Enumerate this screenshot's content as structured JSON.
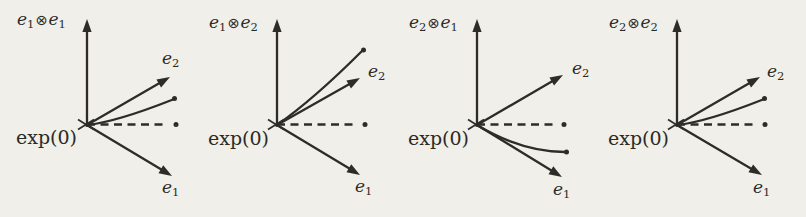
{
  "figure": {
    "background": "#f1efe9",
    "ink": "#2e2c29",
    "basis_base": "e",
    "tensor_op": "⊗",
    "e1_sub": "1",
    "e2_sub": "2",
    "origin_label": "exp(0)",
    "panels": [
      {
        "id": "e1e1",
        "left_sub": "1",
        "right_sub": "1",
        "labels": {
          "title": {
            "x": 17,
            "y": 10
          },
          "exp": {
            "x": 16,
            "y": 127
          },
          "e2": {
            "x": 162,
            "y": 49
          },
          "e1": {
            "x": 162,
            "y": 178
          }
        },
        "geometry": {
          "origin": {
            "x": 87,
            "y": 125
          },
          "axis_tip": {
            "x": 87,
            "y": 19
          },
          "e2_tip": {
            "x": 170,
            "y": 77
          },
          "e1_tip": {
            "x": 172,
            "y": 176
          },
          "dash_end": {
            "x": 168,
            "y": 124.5
          },
          "dash_dot": {
            "x": 176,
            "y": 124.5
          },
          "curve_path": "M 87 125 Q 116 122 173 99.5",
          "curve_dot": {
            "x": 174.5,
            "y": 98.5
          }
        }
      },
      {
        "id": "e1e2",
        "left_sub": "1",
        "right_sub": "2",
        "labels": {
          "title": {
            "x": 209,
            "y": 13
          },
          "exp": {
            "x": 208,
            "y": 128
          },
          "e2": {
            "x": 368,
            "y": 62
          },
          "e1": {
            "x": 355,
            "y": 177
          }
        },
        "geometry": {
          "origin": {
            "x": 277,
            "y": 125
          },
          "axis_tip": {
            "x": 277,
            "y": 19
          },
          "e2_tip": {
            "x": 360,
            "y": 78
          },
          "e1_tip": {
            "x": 360,
            "y": 175
          },
          "dash_end": {
            "x": 357,
            "y": 124.5
          },
          "dash_dot": {
            "x": 365,
            "y": 124.5
          },
          "curve_path": "M 277 125 Q 314 99 362 51",
          "curve_dot": {
            "x": 363.5,
            "y": 50
          }
        }
      },
      {
        "id": "e2e1",
        "left_sub": "2",
        "right_sub": "1",
        "labels": {
          "title": {
            "x": 409,
            "y": 13
          },
          "exp": {
            "x": 408,
            "y": 128
          },
          "e2": {
            "x": 572,
            "y": 59
          },
          "e1": {
            "x": 553,
            "y": 180
          }
        },
        "geometry": {
          "origin": {
            "x": 477,
            "y": 125
          },
          "axis_tip": {
            "x": 477,
            "y": 19
          },
          "e2_tip": {
            "x": 563,
            "y": 75
          },
          "e1_tip": {
            "x": 562,
            "y": 177
          },
          "dash_end": {
            "x": 556,
            "y": 124.5
          },
          "dash_dot": {
            "x": 564,
            "y": 124.5
          },
          "curve_path": "M 477 125 Q 522 152 565 152",
          "curve_dot": {
            "x": 566.5,
            "y": 152
          }
        }
      },
      {
        "id": "e2e2",
        "left_sub": "2",
        "right_sub": "2",
        "labels": {
          "title": {
            "x": 609,
            "y": 13
          },
          "exp": {
            "x": 608,
            "y": 128
          },
          "e2": {
            "x": 767,
            "y": 62
          },
          "e1": {
            "x": 753,
            "y": 178
          }
        },
        "geometry": {
          "origin": {
            "x": 677,
            "y": 125
          },
          "axis_tip": {
            "x": 677,
            "y": 19
          },
          "e2_tip": {
            "x": 760,
            "y": 77
          },
          "e1_tip": {
            "x": 762,
            "y": 175
          },
          "dash_end": {
            "x": 757,
            "y": 124.5
          },
          "dash_dot": {
            "x": 765,
            "y": 124.5
          },
          "curve_path": "M 677 125 Q 706 122 763 99.5",
          "curve_dot": {
            "x": 764.5,
            "y": 98.5
          }
        }
      }
    ]
  }
}
